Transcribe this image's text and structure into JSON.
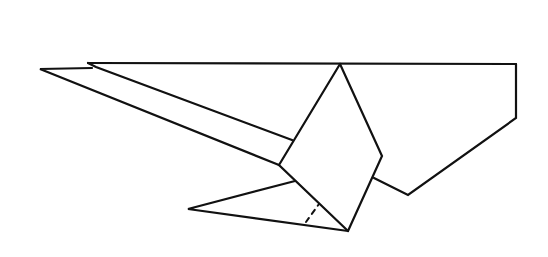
{
  "figure": {
    "type": "origami-fold-diagram",
    "stroke_color": "#111111",
    "background_color": "#ffffff"
  }
}
